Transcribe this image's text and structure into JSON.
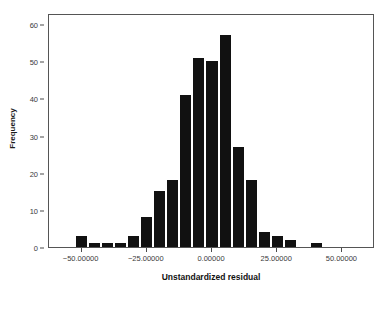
{
  "chart_data": {
    "type": "bar",
    "title": "",
    "subtitle": "",
    "xlabel": "Unstandardized residual",
    "ylabel": "Frequency",
    "grid": false,
    "legend": null,
    "xlim": [
      -62.5,
      62.5
    ],
    "ylim": [
      0,
      63
    ],
    "bin_width": 5,
    "xticks": [
      -50,
      -25,
      0,
      25,
      50
    ],
    "xtick_labels": [
      "−50.00000",
      "−25.00000",
      "0.00000",
      "25.00000",
      "50.00000"
    ],
    "yticks": [
      0,
      10,
      20,
      30,
      40,
      50,
      60
    ],
    "ytick_labels": [
      "0",
      "10",
      "20",
      "30",
      "40",
      "50",
      "60"
    ],
    "bar_color": "#111111",
    "bin_centers": [
      -50,
      -45,
      -40,
      -35,
      -30,
      -25,
      -20,
      -15,
      -10,
      -5,
      0,
      5,
      10,
      15,
      20,
      25,
      30,
      35,
      40,
      45
    ],
    "categories": [
      "-50",
      "-45",
      "-40",
      "-35",
      "-30",
      "-25",
      "-20",
      "-15",
      "-10",
      "-5",
      "0",
      "5",
      "10",
      "15",
      "20",
      "25",
      "30",
      "35",
      "40",
      "45"
    ],
    "values": [
      3,
      1,
      1,
      1,
      3,
      8,
      15,
      18,
      41,
      51,
      50,
      57,
      27,
      18,
      4,
      3,
      2,
      0,
      1,
      0
    ]
  },
  "axis": {
    "x_title": "Unstandardized residual",
    "y_title": "Frequency"
  }
}
